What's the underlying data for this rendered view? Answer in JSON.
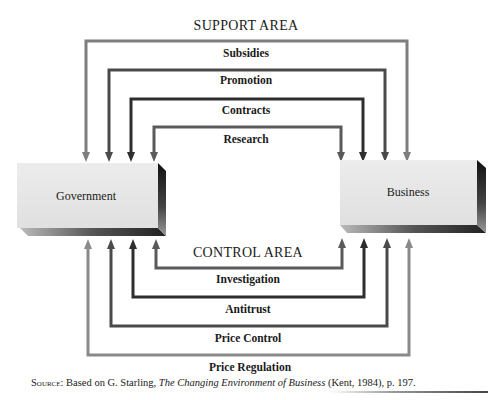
{
  "diagram": {
    "support_area": {
      "title": "SUPPORT AREA",
      "flows": [
        {
          "label": "Subsidies",
          "color": "#7e7e7e"
        },
        {
          "label": "Promotion",
          "color": "#4a4a4a"
        },
        {
          "label": "Contracts",
          "color": "#2e2e2e"
        },
        {
          "label": "Research",
          "color": "#5a5a5a"
        }
      ],
      "direction": "Government to Business (arrows point down into both boxes)"
    },
    "control_area": {
      "title": "CONTROL AREA",
      "flows": [
        {
          "label": "Investigation",
          "color": "#5a5a5a"
        },
        {
          "label": "Antitrust",
          "color": "#2e2e2e"
        },
        {
          "label": "Price Control",
          "color": "#4a4a4a"
        },
        {
          "label": "Price Regulation",
          "color": "#8a8a8a"
        }
      ]
    },
    "nodes": {
      "government": "Government",
      "business": "Business"
    }
  },
  "source": {
    "prefix": "Source:",
    "text_before": " Based on G. Starling, ",
    "title": "The Changing Environment of Business",
    "text_after": " (Kent, 1984), p. 197."
  }
}
